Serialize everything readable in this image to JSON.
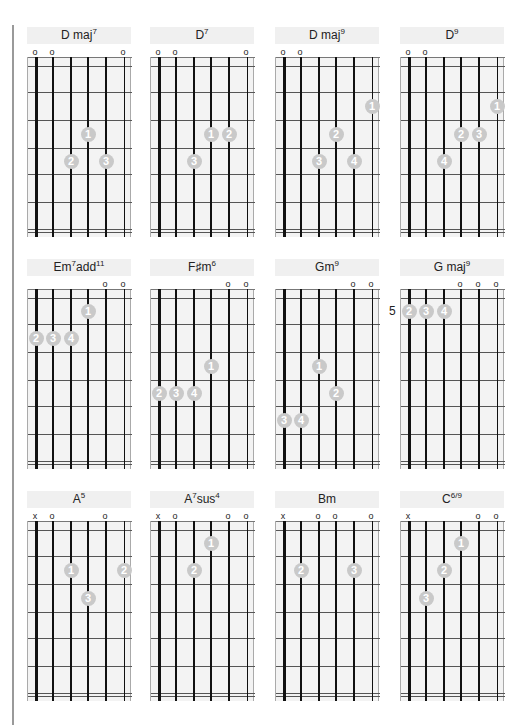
{
  "page": {
    "colors": {
      "title_bg": "#f0f0f0",
      "board_bg": "#f3f3f3",
      "dot": "#c9c9c9",
      "string": "#111111",
      "margin_rule": "#9a9a9a"
    }
  },
  "chords": [
    {
      "name": "D maj",
      "sup": "7",
      "row": 0,
      "col": 0,
      "marks": [
        "o",
        "o",
        "",
        "",
        "",
        "o"
      ],
      "dots": [
        {
          "string": 4,
          "fret": 3,
          "finger": "1"
        },
        {
          "string": 3,
          "fret": 4,
          "finger": "2"
        },
        {
          "string": 5,
          "fret": 4,
          "finger": "3"
        }
      ]
    },
    {
      "name": "D",
      "sup": "7",
      "row": 0,
      "col": 1,
      "marks": [
        "o",
        "o",
        "",
        "",
        "",
        "o"
      ],
      "dots": [
        {
          "string": 4,
          "fret": 3,
          "finger": "1"
        },
        {
          "string": 5,
          "fret": 3,
          "finger": "2"
        },
        {
          "string": 3,
          "fret": 4,
          "finger": "3"
        }
      ]
    },
    {
      "name": "D maj",
      "sup": "9",
      "row": 0,
      "col": 2,
      "marks": [
        "o",
        "o",
        "",
        "",
        "",
        ""
      ],
      "dots": [
        {
          "string": 6,
          "fret": 2,
          "finger": "1"
        },
        {
          "string": 4,
          "fret": 3,
          "finger": "2"
        },
        {
          "string": 3,
          "fret": 4,
          "finger": "3"
        },
        {
          "string": 5,
          "fret": 4,
          "finger": "4"
        }
      ]
    },
    {
      "name": "D",
      "sup": "9",
      "row": 0,
      "col": 3,
      "marks": [
        "o",
        "o",
        "",
        "",
        "",
        ""
      ],
      "dots": [
        {
          "string": 6,
          "fret": 2,
          "finger": "1"
        },
        {
          "string": 4,
          "fret": 3,
          "finger": "2"
        },
        {
          "string": 5,
          "fret": 3,
          "finger": "3"
        },
        {
          "string": 3,
          "fret": 4,
          "finger": "4"
        }
      ]
    },
    {
      "name": "Em",
      "sup": "7",
      "suffix": "add",
      "sup2": "11",
      "row": 1,
      "col": 0,
      "marks": [
        "",
        "",
        "",
        "",
        "o",
        "o"
      ],
      "dots": [
        {
          "string": 4,
          "fret": 1,
          "finger": "1"
        },
        {
          "string": 1,
          "fret": 2,
          "finger": "2"
        },
        {
          "string": 2,
          "fret": 2,
          "finger": "3"
        },
        {
          "string": 3,
          "fret": 2,
          "finger": "4"
        }
      ]
    },
    {
      "name": "F♯m",
      "sup": "6",
      "row": 1,
      "col": 1,
      "marks": [
        "",
        "",
        "",
        "",
        "o",
        "o"
      ],
      "dots": [
        {
          "string": 4,
          "fret": 3,
          "finger": "1"
        },
        {
          "string": 1,
          "fret": 4,
          "finger": "2"
        },
        {
          "string": 2,
          "fret": 4,
          "finger": "3"
        },
        {
          "string": 3,
          "fret": 4,
          "finger": "4"
        }
      ]
    },
    {
      "name": "Gm",
      "sup": "9",
      "row": 1,
      "col": 2,
      "marks": [
        "",
        "",
        "",
        "",
        "o",
        "o"
      ],
      "dots": [
        {
          "string": 3,
          "fret": 3,
          "finger": "1"
        },
        {
          "string": 4,
          "fret": 4,
          "finger": "2"
        },
        {
          "string": 1,
          "fret": 5,
          "finger": "3"
        },
        {
          "string": 2,
          "fret": 5,
          "finger": "4"
        }
      ]
    },
    {
      "name": "G maj",
      "sup": "9",
      "row": 1,
      "col": 3,
      "position": "5",
      "marks": [
        "",
        "",
        "",
        "o",
        "o",
        "o"
      ],
      "dots": [
        {
          "string": 1,
          "fret": 1,
          "finger": "2"
        },
        {
          "string": 2,
          "fret": 1,
          "finger": "3"
        },
        {
          "string": 3,
          "fret": 1,
          "finger": "4"
        }
      ]
    },
    {
      "name": "A",
      "sup": "5",
      "row": 2,
      "col": 0,
      "marks": [
        "x",
        "o",
        "",
        "",
        "o",
        ""
      ],
      "dots": [
        {
          "string": 3,
          "fret": 2,
          "finger": "1"
        },
        {
          "string": 6,
          "fret": 2,
          "finger": "2"
        },
        {
          "string": 4,
          "fret": 3,
          "finger": "3"
        }
      ]
    },
    {
      "name": "A",
      "sup": "7",
      "suffix": "sus",
      "sup2": "4",
      "row": 2,
      "col": 1,
      "marks": [
        "x",
        "o",
        "",
        "",
        "o",
        "o"
      ],
      "dots": [
        {
          "string": 4,
          "fret": 1,
          "finger": "1"
        },
        {
          "string": 3,
          "fret": 2,
          "finger": "2"
        }
      ]
    },
    {
      "name": "Bm",
      "sup": "",
      "row": 2,
      "col": 2,
      "marks": [
        "x",
        "",
        "o",
        "o",
        "",
        "o"
      ],
      "dots": [
        {
          "string": 2,
          "fret": 2,
          "finger": "2"
        },
        {
          "string": 5,
          "fret": 2,
          "finger": "3"
        }
      ]
    },
    {
      "name": "C",
      "sup": "6/9",
      "row": 2,
      "col": 3,
      "marks": [
        "x",
        "",
        "",
        "",
        "o",
        "o"
      ],
      "dots": [
        {
          "string": 4,
          "fret": 1,
          "finger": "1"
        },
        {
          "string": 3,
          "fret": 2,
          "finger": "2"
        },
        {
          "string": 2,
          "fret": 3,
          "finger": "3"
        }
      ]
    }
  ]
}
